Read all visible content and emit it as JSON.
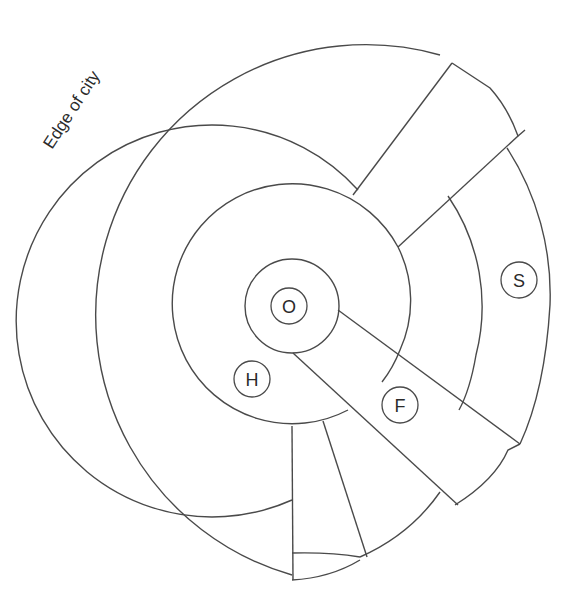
{
  "diagram": {
    "type": "urban-land-use-model",
    "edge_label": "Edge of city",
    "zones": [
      {
        "id": "O",
        "label": "O",
        "position": "center"
      },
      {
        "id": "H",
        "label": "H",
        "position": "inner ring, lower-left"
      },
      {
        "id": "F",
        "label": "F",
        "position": "sector, lower-right"
      },
      {
        "id": "S",
        "label": "S",
        "position": "outer ring, right"
      }
    ],
    "colors": {
      "stroke": "#4a4a4a",
      "background": "#ffffff",
      "text": "#2a2a2a"
    }
  }
}
